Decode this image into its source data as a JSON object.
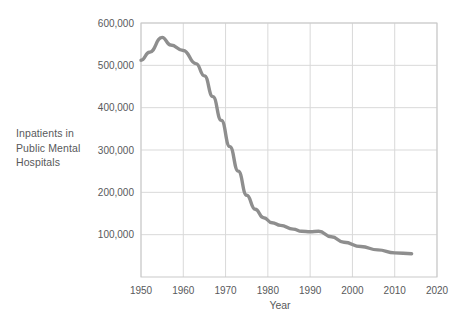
{
  "chart_data": {
    "type": "line",
    "title": "",
    "xlabel": "Year",
    "ylabel": "Inpatients in Public Mental Hospitals",
    "ylabel_lines": [
      "Inpatients in",
      "Public Mental",
      "Hospitals"
    ],
    "xlim": [
      1950,
      2020
    ],
    "ylim": [
      0,
      600000
    ],
    "grid": true,
    "legend": "none",
    "line_color": "#8e8e8e",
    "grid_color": "#d9d9d9",
    "frame_color": "#c9c9c9",
    "text_color": "#58595b",
    "xticks": [
      1950,
      1960,
      1970,
      1980,
      1990,
      2000,
      2010,
      2020
    ],
    "xtick_labels": [
      "1950",
      "1960",
      "1970",
      "1980",
      "1990",
      "2000",
      "2010",
      "2020"
    ],
    "yticks": [
      100000,
      200000,
      300000,
      400000,
      500000,
      600000
    ],
    "ytick_labels": [
      "100,000",
      "200,000",
      "300,000",
      "400,000",
      "500,000",
      "600,000"
    ],
    "series": [
      {
        "name": "Inpatients in Public Mental Hospitals",
        "x": [
          1950,
          1952,
          1955,
          1957,
          1960,
          1963,
          1965,
          1967,
          1969,
          1971,
          1973,
          1975,
          1977,
          1979,
          1981,
          1983,
          1986,
          1988,
          1990,
          1992,
          1995,
          1998,
          2002,
          2006,
          2010,
          2014
        ],
        "values": [
          512000,
          531000,
          566000,
          548000,
          535000,
          504000,
          475000,
          426000,
          370000,
          308000,
          250000,
          193000,
          160000,
          140000,
          128000,
          122000,
          113000,
          108000,
          107000,
          108000,
          95000,
          82000,
          72000,
          64000,
          57000,
          55000
        ]
      }
    ]
  }
}
